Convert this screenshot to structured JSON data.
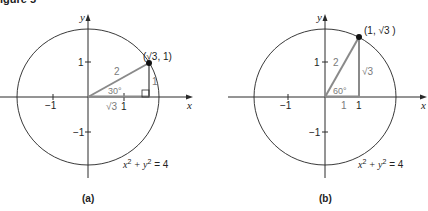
{
  "figure": {
    "caption_fragment": "igure 5",
    "panels": [
      {
        "id": "a",
        "label": "(a)",
        "x_axis_label": "x",
        "y_axis_label": "y",
        "tick_x_neg": "−1",
        "tick_x_pos": "1",
        "tick_y_pos": "1",
        "tick_y_neg": "−1",
        "point_label": "(√3, 1)",
        "hypotenuse_label": "2",
        "opposite_label": "1",
        "adjacent_label": "√3",
        "angle_label": "30°",
        "equation_base": "x",
        "equation_mid": " + y",
        "equation_end": " = 4",
        "exp": "2"
      },
      {
        "id": "b",
        "label": "(b)",
        "x_axis_label": "x",
        "y_axis_label": "y",
        "tick_x_neg": "−1",
        "tick_x_pos": "1",
        "tick_y_pos": "1",
        "tick_y_neg": "−1",
        "point_label": "(1, √3 )",
        "hypotenuse_label": "2",
        "opposite_label": "√3",
        "adjacent_label": "1",
        "angle_label": "60°",
        "foot_label": "1",
        "equation_base": "x",
        "equation_mid": " + y",
        "equation_end": " = 4",
        "exp": "2"
      }
    ],
    "colors": {
      "axis": "#2a2a2a",
      "circle": "#3a3a3a",
      "triangle": "#8a8a8a",
      "gray_text": "#7a7a7a",
      "point": "#111111"
    }
  }
}
